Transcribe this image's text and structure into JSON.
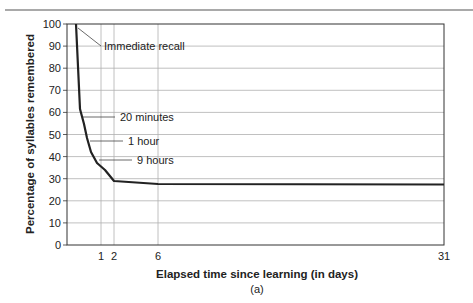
{
  "chart_data": {
    "type": "line",
    "title": "",
    "caption": "(a)",
    "xlabel": "Elapsed time since learning (in days)",
    "ylabel": "Percentage of syllables remembered",
    "ylim": [
      0,
      100
    ],
    "xlim": [
      0,
      31
    ],
    "y_ticks": [
      0,
      10,
      20,
      30,
      40,
      50,
      60,
      70,
      80,
      90,
      100
    ],
    "x_ticks": [
      1,
      2,
      6,
      31
    ],
    "grid": true,
    "series": [
      {
        "name": "Forgetting curve",
        "x": [
          0,
          0.014,
          0.042,
          0.375,
          1,
          2,
          6,
          31
        ],
        "y": [
          100,
          58,
          45,
          37,
          33,
          29,
          27,
          27
        ]
      }
    ],
    "annotations": [
      {
        "label": "Immediate recall",
        "y": 100
      },
      {
        "label": "20 minutes",
        "y": 58
      },
      {
        "label": "1 hour",
        "y": 45
      },
      {
        "label": "9 hours",
        "y": 37
      }
    ],
    "colors": {
      "line": "#222222",
      "grid": "#aaaaaa",
      "frame": "#333333",
      "rule": "#555555"
    }
  }
}
